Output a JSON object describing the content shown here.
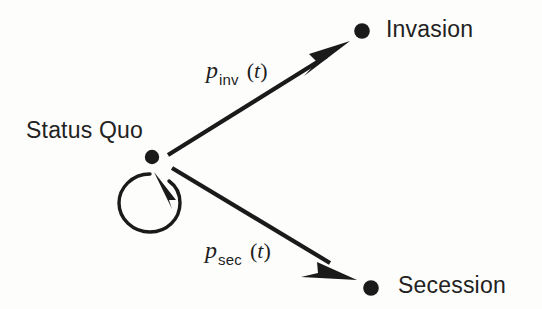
{
  "diagram": {
    "background_color": "#fdfdfc",
    "ink_color": "#1a1a1a",
    "nodes": [
      {
        "id": "status-quo",
        "label": "Status Quo",
        "x": 152,
        "y": 157,
        "radius": 7,
        "label_x": 26,
        "label_y": 119
      },
      {
        "id": "invasion",
        "label": "Invasion",
        "x": 362,
        "y": 31,
        "radius": 7.5,
        "label_x": 386,
        "label_y": 18
      },
      {
        "id": "secession",
        "label": "Secession",
        "x": 371,
        "y": 288,
        "radius": 7.5,
        "label_x": 398,
        "label_y": 274
      }
    ],
    "edges": [
      {
        "id": "edge-invasion",
        "from": "status-quo",
        "to": "invasion",
        "kind": "straight-arrow",
        "label_var": "p",
        "label_sub": "inv",
        "label_arg": "(t)",
        "label_x": 206,
        "label_y": 58,
        "start_x": 168,
        "start_y": 155,
        "end_x": 349,
        "end_y": 42
      },
      {
        "id": "edge-secession",
        "from": "status-quo",
        "to": "secession",
        "kind": "straight-arrow",
        "label_var": "p",
        "label_sub": "sec",
        "label_arg": "(t)",
        "label_x": 205,
        "label_y": 238,
        "start_x": 172,
        "start_y": 168,
        "end_x": 356,
        "end_y": 280
      },
      {
        "id": "edge-self-loop",
        "from": "status-quo",
        "to": "status-quo",
        "kind": "self-loop-arrow",
        "label_var": "",
        "label_sub": "",
        "label_arg": "",
        "center_x": 150,
        "center_y": 203,
        "radius": 29
      }
    ]
  }
}
